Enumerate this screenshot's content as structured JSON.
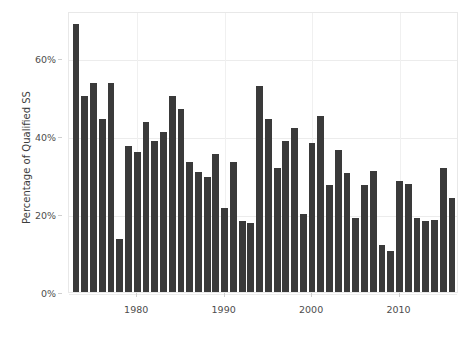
{
  "chart_data": {
    "type": "bar",
    "title": "",
    "subtitle": "",
    "xlabel": "",
    "ylabel": "Percentage of Qualified SS",
    "xlim": [
      1972.2,
      2016.8
    ],
    "ylim": [
      0,
      72
    ],
    "grid": true,
    "legend": null,
    "bar_color": "#3a3a3a",
    "background_color": "#ffffff",
    "gridline_color": "#ececec",
    "y_ticks": [
      0,
      20,
      40,
      60
    ],
    "y_tick_labels": [
      "0%",
      "20%",
      "40%",
      "60%"
    ],
    "x_ticks": [
      1980,
      1990,
      2000,
      2010
    ],
    "x_tick_labels": [
      "1980",
      "1990",
      "2000",
      "2010"
    ],
    "categories": [
      1973,
      1974,
      1975,
      1976,
      1977,
      1978,
      1979,
      1980,
      1981,
      1982,
      1983,
      1984,
      1985,
      1986,
      1987,
      1988,
      1989,
      1990,
      1991,
      1992,
      1993,
      1994,
      1995,
      1996,
      1997,
      1998,
      1999,
      2000,
      2001,
      2002,
      2003,
      2004,
      2005,
      2006,
      2007,
      2008,
      2009,
      2010,
      2011,
      2012,
      2013,
      2014,
      2015,
      2016
    ],
    "values": [
      68.8,
      50.3,
      53.5,
      44.3,
      53.5,
      13.5,
      37.5,
      35.8,
      43.5,
      38.8,
      41.0,
      50.3,
      46.8,
      33.3,
      30.8,
      29.5,
      35.3,
      21.5,
      33.3,
      18.3,
      17.8,
      52.8,
      44.3,
      31.8,
      38.8,
      42.0,
      20.0,
      38.3,
      45.0,
      27.3,
      36.5,
      30.5,
      19.0,
      27.3,
      31.0,
      12.0,
      10.5,
      28.5,
      27.8,
      19.0,
      18.3,
      18.5,
      31.8,
      24.0
    ],
    "value_unit": "%"
  },
  "axis": {
    "y_title": "Percentage of Qualified SS"
  }
}
